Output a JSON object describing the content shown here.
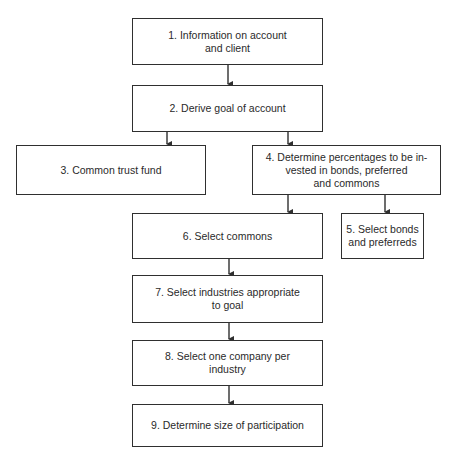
{
  "diagram": {
    "type": "flowchart",
    "nodes": [
      {
        "id": "1",
        "label": "1. Information on account\nand client"
      },
      {
        "id": "2",
        "label": "2. Derive goal of account"
      },
      {
        "id": "3",
        "label": "3. Common trust fund"
      },
      {
        "id": "4",
        "label": "4. Determine percentages to be in-\nvested in bonds, preferred\nand commons"
      },
      {
        "id": "5",
        "label": "5. Select bonds\nand preferreds"
      },
      {
        "id": "6",
        "label": "6. Select commons"
      },
      {
        "id": "7",
        "label": "7. Select industries appropriate\nto goal"
      },
      {
        "id": "8",
        "label": "8. Select one company per\nindustry"
      },
      {
        "id": "9",
        "label": "9. Determine size of participation"
      }
    ],
    "edges": [
      {
        "from": "1",
        "to": "2"
      },
      {
        "from": "2",
        "to": "3"
      },
      {
        "from": "2",
        "to": "4"
      },
      {
        "from": "4",
        "to": "6"
      },
      {
        "from": "4",
        "to": "5"
      },
      {
        "from": "6",
        "to": "7"
      },
      {
        "from": "7",
        "to": "8"
      },
      {
        "from": "8",
        "to": "9"
      }
    ],
    "colors": {
      "line": "#2f2f2f",
      "background": "#ffffff",
      "text": "#2a2a2a"
    }
  }
}
